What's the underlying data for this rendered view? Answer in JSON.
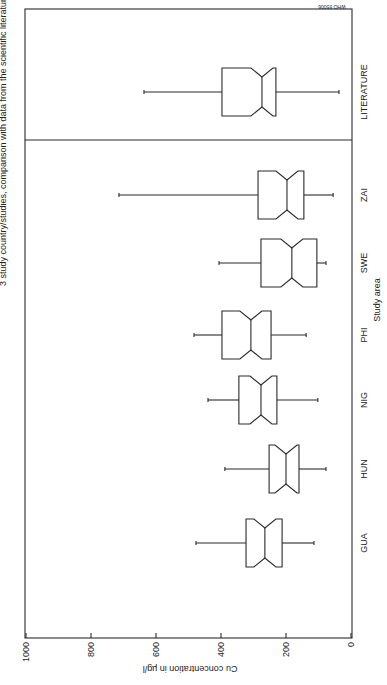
{
  "figure": {
    "title": "3 study country/studies, comparison with data from the scientific literature (Cu)",
    "watermark": "WHO 85006",
    "orientation": "rotated-90-clockwise"
  },
  "chart_data": {
    "type": "boxplot",
    "title": "3 study country/studies, comparison with data from the scientific literature (Cu)",
    "xlabel": "Study area",
    "ylabel": "Cu concentration in µg/l",
    "ylim": [
      0,
      1000
    ],
    "yticks": [
      0,
      200,
      400,
      600,
      800,
      1000
    ],
    "notched": true,
    "categories": [
      "GUA",
      "HUN",
      "NIG",
      "PHI",
      "SWE",
      "ZAI",
      "LITERATURE"
    ],
    "series": [
      {
        "name": "GUA",
        "whisker_low": 114,
        "q1": 212,
        "median": 265,
        "q3": 323,
        "whisker_high": 477
      },
      {
        "name": "HUN",
        "whisker_low": 77,
        "q1": 160,
        "median": 200,
        "q3": 252,
        "whisker_high": 388
      },
      {
        "name": "NIG",
        "whisker_low": 102,
        "q1": 228,
        "median": 277,
        "q3": 345,
        "whisker_high": 440
      },
      {
        "name": "PHI",
        "whisker_low": 138,
        "q1": 246,
        "median": 308,
        "q3": 397,
        "whisker_high": 483
      },
      {
        "name": "SWE",
        "whisker_low": 77,
        "q1": 105,
        "median": 182,
        "q3": 277,
        "whisker_high": 406
      },
      {
        "name": "ZAI",
        "whisker_low": 55,
        "q1": 145,
        "median": 197,
        "q3": 286,
        "whisker_high": 714
      },
      {
        "name": "LITERATURE",
        "whisker_low": 37,
        "q1": 231,
        "median": 274,
        "q3": 397,
        "whisker_high": 637
      }
    ],
    "separator_after": "ZAI",
    "grid": false,
    "legend": null
  }
}
